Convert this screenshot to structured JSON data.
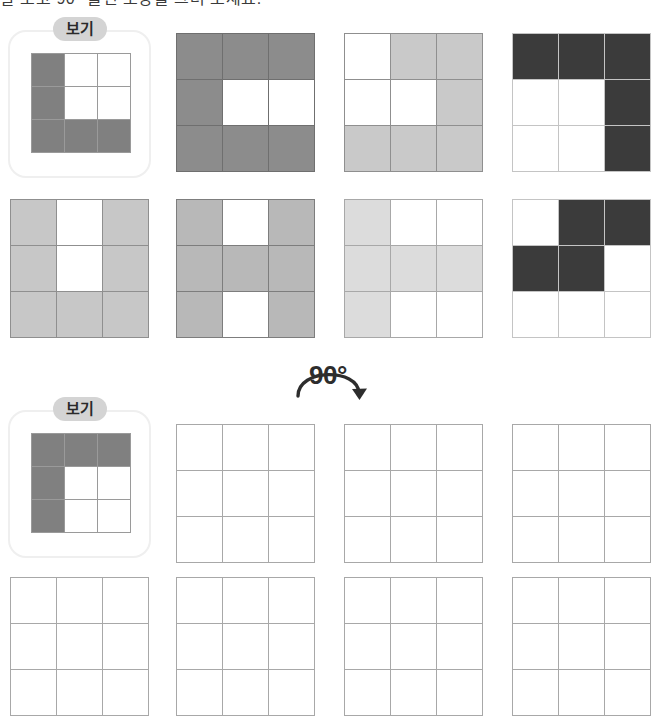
{
  "page": {
    "title_strip": "잘 보고 90° 돌린 모양을 그려 보세요.",
    "width": 654,
    "height": 719
  },
  "palette": {
    "fill_medium_gray": "#808080",
    "fill_gray": "#8c8c8c",
    "fill_light_gray": "#c7c7c7",
    "fill_lighter_gray": "#d6d6d6",
    "fill_pale_gray": "#dedede",
    "fill_dark_gray": "#3b3b3b",
    "cell_border": "#9a9a9a",
    "cell_border_light": "#a8a8a8",
    "empty_cell": "#ffffff",
    "card_border": "#efefef",
    "badge_bg": "#d4d4d4",
    "ink": "#2d2d2d"
  },
  "rotation_marker": {
    "label": "90°",
    "icon": "rotate-clockwise-arrow-icon",
    "direction": "clockwise"
  },
  "example_top": {
    "badge_label": "보기",
    "icon": "example-badge-icon",
    "grid": {
      "name": "example-grid-top",
      "fill_color": "#808080",
      "border_color": "#9a9a9a",
      "rows": 3,
      "cols": 3,
      "cells": [
        [
          1,
          0,
          0
        ],
        [
          1,
          0,
          0
        ],
        [
          1,
          1,
          1
        ]
      ],
      "shape_description": "L-shape: left column plus bottom row"
    }
  },
  "example_bottom": {
    "badge_label": "보기",
    "icon": "example-badge-icon",
    "grid": {
      "name": "example-grid-bottom",
      "fill_color": "#808080",
      "border_color": "#9a9a9a",
      "rows": 3,
      "cols": 3,
      "cells": [
        [
          1,
          1,
          1
        ],
        [
          1,
          0,
          0
        ],
        [
          1,
          0,
          0
        ]
      ],
      "shape_description": "L-shape rotated 90 degrees clockwise: top row plus left column"
    }
  },
  "question_grids": [
    {
      "name": "question-grid-1",
      "row": 1,
      "col": 2,
      "fill_color": "#8c8c8c",
      "border_color": "#6f6f6f",
      "cells": [
        [
          1,
          1,
          1
        ],
        [
          1,
          0,
          0
        ],
        [
          1,
          1,
          1
        ]
      ],
      "shape_description": "C-shape open to the right"
    },
    {
      "name": "question-grid-2",
      "row": 1,
      "col": 3,
      "fill_color": "#c9c9c9",
      "border_color": "#8f8f8f",
      "cells": [
        [
          0,
          1,
          1
        ],
        [
          0,
          0,
          1
        ],
        [
          1,
          1,
          1
        ]
      ],
      "shape_description": "Hook shape wrapping top-right to bottom"
    },
    {
      "name": "question-grid-3",
      "row": 1,
      "col": 4,
      "fill_color": "#3b3b3b",
      "border_color": "#c4c4c4",
      "cells": [
        [
          1,
          1,
          1
        ],
        [
          0,
          0,
          1
        ],
        [
          0,
          0,
          1
        ]
      ],
      "shape_description": "Mirrored L: top row plus right column"
    },
    {
      "name": "question-grid-4",
      "row": 2,
      "col": 1,
      "fill_color": "#c7c7c7",
      "border_color": "#8f8f8f",
      "cells": [
        [
          1,
          0,
          1
        ],
        [
          1,
          0,
          1
        ],
        [
          1,
          1,
          1
        ]
      ],
      "shape_description": "U-shape open at the top"
    },
    {
      "name": "question-grid-5",
      "row": 2,
      "col": 2,
      "fill_color": "#b8b8b8",
      "border_color": "#7d7d7d",
      "cells": [
        [
          1,
          0,
          1
        ],
        [
          1,
          1,
          1
        ],
        [
          1,
          0,
          1
        ]
      ],
      "shape_description": "H-shape"
    },
    {
      "name": "question-grid-6",
      "row": 2,
      "col": 3,
      "fill_color": "#dcdcdc",
      "border_color": "#a8a8a8",
      "cells": [
        [
          1,
          0,
          0
        ],
        [
          1,
          1,
          1
        ],
        [
          1,
          0,
          0
        ]
      ],
      "shape_description": "T-shape rotated: left column plus middle row"
    },
    {
      "name": "question-grid-7",
      "row": 2,
      "col": 4,
      "fill_color": "#3b3b3b",
      "border_color": "#c4c4c4",
      "cells": [
        [
          0,
          1,
          1
        ],
        [
          1,
          1,
          0
        ],
        [
          0,
          0,
          0
        ]
      ],
      "shape_description": "S / Z offset shape in the upper two rows"
    }
  ],
  "answer_grids": [
    {
      "name": "answer-grid-1",
      "row": 3,
      "col": 2,
      "border_color": "#a8a8a8",
      "cells": [
        [
          0,
          0,
          0
        ],
        [
          0,
          0,
          0
        ],
        [
          0,
          0,
          0
        ]
      ]
    },
    {
      "name": "answer-grid-2",
      "row": 3,
      "col": 3,
      "border_color": "#a8a8a8",
      "cells": [
        [
          0,
          0,
          0
        ],
        [
          0,
          0,
          0
        ],
        [
          0,
          0,
          0
        ]
      ]
    },
    {
      "name": "answer-grid-3",
      "row": 3,
      "col": 4,
      "border_color": "#a8a8a8",
      "cells": [
        [
          0,
          0,
          0
        ],
        [
          0,
          0,
          0
        ],
        [
          0,
          0,
          0
        ]
      ]
    },
    {
      "name": "answer-grid-4",
      "row": 4,
      "col": 1,
      "border_color": "#a8a8a8",
      "cells": [
        [
          0,
          0,
          0
        ],
        [
          0,
          0,
          0
        ],
        [
          0,
          0,
          0
        ]
      ]
    },
    {
      "name": "answer-grid-5",
      "row": 4,
      "col": 2,
      "border_color": "#a8a8a8",
      "cells": [
        [
          0,
          0,
          0
        ],
        [
          0,
          0,
          0
        ],
        [
          0,
          0,
          0
        ]
      ]
    },
    {
      "name": "answer-grid-6",
      "row": 4,
      "col": 3,
      "border_color": "#a8a8a8",
      "cells": [
        [
          0,
          0,
          0
        ],
        [
          0,
          0,
          0
        ],
        [
          0,
          0,
          0
        ]
      ]
    },
    {
      "name": "answer-grid-7",
      "row": 4,
      "col": 4,
      "border_color": "#a8a8a8",
      "cells": [
        [
          0,
          0,
          0
        ],
        [
          0,
          0,
          0
        ],
        [
          0,
          0,
          0
        ]
      ]
    }
  ],
  "layout": {
    "example_top_card": {
      "x": 8,
      "y": 30,
      "w": 143,
      "h": 148
    },
    "example_top_grid": {
      "x": 31,
      "y": 53,
      "w": 96,
      "h": 96
    },
    "example_bottom_card": {
      "x": 8,
      "y": 410,
      "w": 143,
      "h": 148
    },
    "example_bottom_grid": {
      "x": 31,
      "y": 433,
      "w": 96,
      "h": 96
    },
    "grid_cols_x": [
      10,
      176,
      344,
      512
    ],
    "grid_row1_y": 33,
    "grid_row2_y": 199,
    "grid_row3_y": 424,
    "grid_row4_y": 577,
    "grid_size": 138,
    "answer_grid_size": 138
  }
}
